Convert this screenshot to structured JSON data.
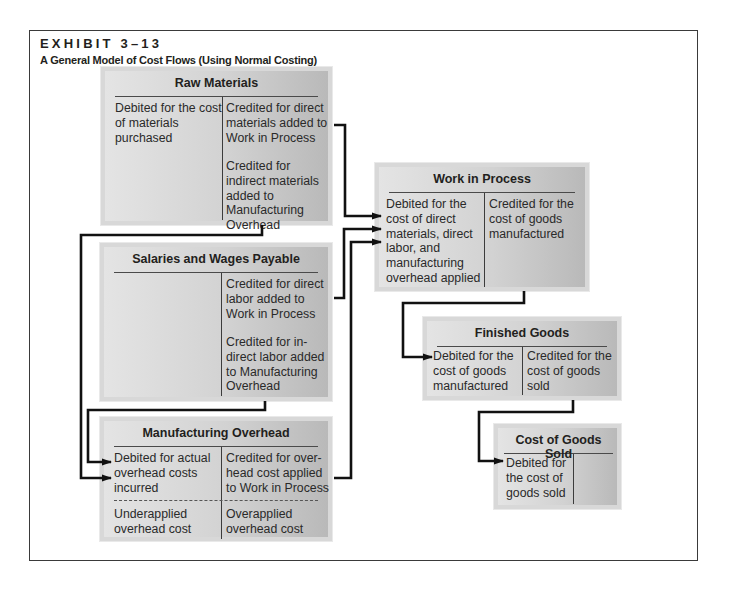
{
  "exhibit": {
    "label": "EXHIBIT 3–13",
    "title": "A General Model of Cost Flows (Using Normal Costing)"
  },
  "accounts": {
    "raw_materials": {
      "title": "Raw Materials",
      "debit": "Debited for the cost of materials purchased",
      "credit_1": "Credited for direct materials added to Work in Process",
      "credit_2": "Credited for indirect materials added to Manufacturing Overhead"
    },
    "salaries_wages_payable": {
      "title": "Salaries and Wages Payable",
      "debit": "",
      "credit_1": "Credited for direct labor added to Work in Process",
      "credit_2": "Credited for in-direct labor added to Manufacturing Overhead"
    },
    "manufacturing_overhead": {
      "title": "Manufacturing Overhead",
      "debit": "Debited for actual overhead costs incurred",
      "credit": "Credited for over-head cost applied to Work in Process",
      "debit_balance": "Underapplied overhead cost",
      "credit_balance": "Overapplied overhead cost"
    },
    "work_in_process": {
      "title": "Work in Process",
      "debit": "Debited for the cost of direct materials, direct labor, and manufacturing overhead applied",
      "credit": "Credited for the cost of goods manufactured"
    },
    "finished_goods": {
      "title": "Finished Goods",
      "debit": "Debited for the cost of goods manufactured",
      "credit": "Credited for the cost of goods sold"
    },
    "cost_of_goods_sold": {
      "title": "Cost of Goods Sold",
      "debit": "Debited for the cost of goods sold",
      "credit": ""
    }
  },
  "flows": [
    {
      "from": "Raw Materials (credit: direct materials)",
      "to": "Work in Process"
    },
    {
      "from": "Raw Materials (credit: indirect materials)",
      "to": "Manufacturing Overhead"
    },
    {
      "from": "Salaries and Wages Payable (credit: direct labor)",
      "to": "Work in Process"
    },
    {
      "from": "Salaries and Wages Payable (credit: indirect labor)",
      "to": "Manufacturing Overhead"
    },
    {
      "from": "Manufacturing Overhead (credit: applied overhead)",
      "to": "Work in Process"
    },
    {
      "from": "Work in Process (credit: cost of goods manufactured)",
      "to": "Finished Goods"
    },
    {
      "from": "Finished Goods (credit: cost of goods sold)",
      "to": "Cost of Goods Sold"
    }
  ],
  "colors": {
    "box_light": "#e4e4e4",
    "box_dark": "#b9b9b9",
    "line": "#111111",
    "frame": "#3a3a3a"
  }
}
